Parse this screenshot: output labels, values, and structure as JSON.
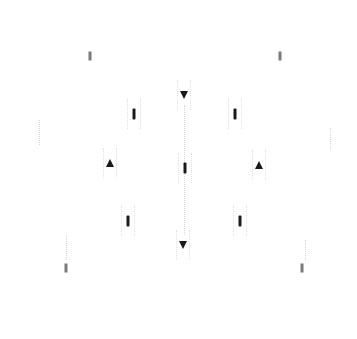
{
  "figure": {
    "colors": {
      "background": "#ffffff",
      "spot": "#1a1a1a",
      "label": "#9a9a9a"
    },
    "outer_labels": [
      {
        "id": "top",
        "text": "",
        "x": 184,
        "y": 19
      },
      {
        "id": "left",
        "text": "",
        "x": 39,
        "y": 154
      },
      {
        "id": "right",
        "text": "",
        "x": 330,
        "y": 156
      },
      {
        "id": "bottom",
        "text": "",
        "x": 183,
        "y": 322
      }
    ],
    "outer_markers": [
      {
        "id": "upper-left",
        "x": 90,
        "y": 56
      },
      {
        "id": "upper-right",
        "x": 280,
        "y": 56
      },
      {
        "id": "lower-left",
        "x": 66,
        "y": 268
      },
      {
        "id": "lower-right",
        "x": 302,
        "y": 268
      }
    ],
    "spots": [
      {
        "id": "top",
        "shape": "tri-down",
        "x": 184,
        "y": 95
      },
      {
        "id": "upper-left",
        "shape": "bar",
        "x": 134,
        "y": 114
      },
      {
        "id": "upper-right",
        "shape": "bar",
        "x": 235,
        "y": 114
      },
      {
        "id": "mid-left",
        "shape": "tri-up",
        "x": 110,
        "y": 163
      },
      {
        "id": "center",
        "shape": "bar",
        "x": 185,
        "y": 168
      },
      {
        "id": "mid-right",
        "shape": "tri-up",
        "x": 259,
        "y": 165
      },
      {
        "id": "lower-left",
        "shape": "bar",
        "x": 128,
        "y": 221
      },
      {
        "id": "lower-right",
        "shape": "bar",
        "x": 240,
        "y": 221
      },
      {
        "id": "bottom",
        "shape": "tri-down",
        "x": 183,
        "y": 245
      }
    ]
  }
}
